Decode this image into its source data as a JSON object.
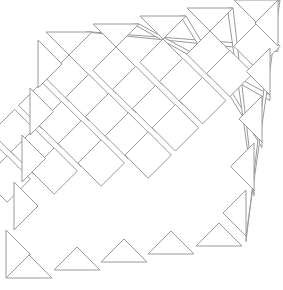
{
  "diagram": {
    "title": "",
    "type": "on-point quilt layout with diagonal sashing strips",
    "canvas": {
      "width": 283,
      "height": 290
    },
    "colors": {
      "background": "#ffffff",
      "stroke": "#9a9a9a",
      "fill": "#ffffff"
    },
    "lattice": {
      "origin": [
        46,
        32
      ],
      "u_vector": [
        23.2,
        23.2
      ],
      "v_vector": [
        -23.2,
        23.2
      ],
      "band_shift": [
        -8,
        0
      ],
      "bands": 5,
      "cells_per_band": 5,
      "strip_width_px": 8
    },
    "setting_triangles": {
      "top": [
        {
          "x1": 46,
          "x2": 92,
          "y": 32
        },
        {
          "x1": 93,
          "x2": 139,
          "y": 24
        },
        {
          "x1": 140,
          "x2": 186,
          "y": 16
        },
        {
          "x1": 187,
          "x2": 233,
          "y": 8
        },
        {
          "x1": 234,
          "x2": 280,
          "y": 0
        }
      ],
      "left": [
        {
          "x": 38,
          "y1": 40,
          "y2": 88
        },
        {
          "x": 30,
          "y1": 88,
          "y2": 135
        },
        {
          "x": 22,
          "y1": 135,
          "y2": 182
        },
        {
          "x": 14,
          "y1": 182,
          "y2": 230
        },
        {
          "x": 6,
          "y1": 230,
          "y2": 278
        }
      ],
      "bottom": [
        {
          "x1": 6,
          "x2": 52,
          "y": 278
        },
        {
          "x1": 54,
          "x2": 100,
          "y": 270
        },
        {
          "x1": 101,
          "x2": 147,
          "y": 262
        },
        {
          "x1": 148,
          "x2": 194,
          "y": 254
        },
        {
          "x1": 196,
          "x2": 242,
          "y": 246
        }
      ],
      "right": [
        {
          "x": 278,
          "y1": 0,
          "y2": 46
        },
        {
          "x": 270,
          "y1": 48,
          "y2": 95
        },
        {
          "x": 262,
          "y1": 96,
          "y2": 142
        },
        {
          "x": 254,
          "y1": 143,
          "y2": 190
        },
        {
          "x": 246,
          "y1": 190,
          "y2": 236
        }
      ]
    },
    "counts": {
      "squares": 25,
      "sashing_strips": 4,
      "top_triangles": 5,
      "left_triangles": 5,
      "bottom_triangles": 5,
      "right_triangles": 5
    }
  }
}
